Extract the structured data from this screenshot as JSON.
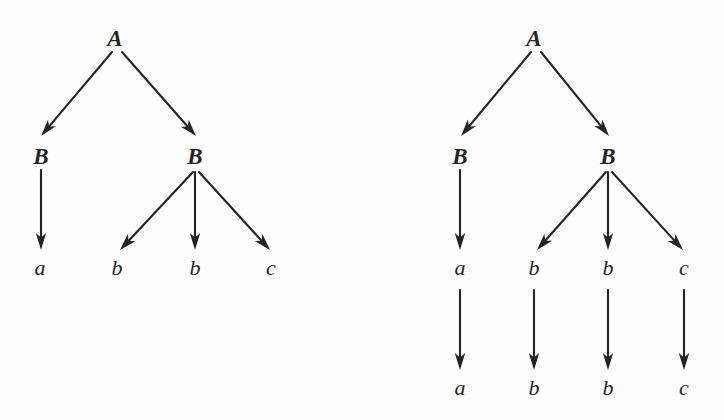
{
  "figure": {
    "caption": "",
    "background_color": "#fdfdfd",
    "ink_color": "#242424",
    "width": 724,
    "height": 420
  },
  "trees": [
    {
      "id": "left-tree",
      "name": "parse-tree-left",
      "nodes": [
        {
          "id": "L-A",
          "label": "A",
          "kind": "nonterminal",
          "x": 115,
          "y": 38
        },
        {
          "id": "L-B1",
          "label": "B",
          "kind": "nonterminal",
          "x": 41,
          "y": 156
        },
        {
          "id": "L-B2",
          "label": "B",
          "kind": "nonterminal",
          "x": 195,
          "y": 156
        },
        {
          "id": "L-a",
          "label": "a",
          "kind": "terminal",
          "x": 40,
          "y": 268
        },
        {
          "id": "L-b1",
          "label": "b",
          "kind": "terminal",
          "x": 117,
          "y": 268
        },
        {
          "id": "L-b2",
          "label": "b",
          "kind": "terminal",
          "x": 195,
          "y": 268
        },
        {
          "id": "L-c",
          "label": "c",
          "kind": "terminal",
          "x": 271,
          "y": 268
        }
      ],
      "edges": [
        {
          "id": "L-e1",
          "from": "L-A",
          "to": "L-B1",
          "x1": 112,
          "y1": 52,
          "x2": 41,
          "y2": 136
        },
        {
          "id": "L-e2",
          "from": "L-A",
          "to": "L-B2",
          "x1": 122,
          "y1": 52,
          "x2": 196,
          "y2": 136
        },
        {
          "id": "L-e3",
          "from": "L-B1",
          "to": "L-a",
          "x1": 41,
          "y1": 170,
          "x2": 41,
          "y2": 250
        },
        {
          "id": "L-e4",
          "from": "L-B2",
          "to": "L-b1",
          "x1": 193,
          "y1": 172,
          "x2": 120,
          "y2": 250
        },
        {
          "id": "L-e5",
          "from": "L-B2",
          "to": "L-b2",
          "x1": 195,
          "y1": 172,
          "x2": 195,
          "y2": 250
        },
        {
          "id": "L-e6",
          "from": "L-B2",
          "to": "L-c",
          "x1": 199,
          "y1": 172,
          "x2": 270,
          "y2": 250
        }
      ]
    },
    {
      "id": "right-tree",
      "name": "parse-tree-right",
      "nodes": [
        {
          "id": "R-A",
          "label": "A",
          "kind": "nonterminal",
          "x": 534,
          "y": 38
        },
        {
          "id": "R-B1",
          "label": "B",
          "kind": "nonterminal",
          "x": 460,
          "y": 156
        },
        {
          "id": "R-B2",
          "label": "B",
          "kind": "nonterminal",
          "x": 608,
          "y": 156
        },
        {
          "id": "R-a1",
          "label": "a",
          "kind": "terminal",
          "x": 460,
          "y": 268
        },
        {
          "id": "R-b1",
          "label": "b",
          "kind": "terminal",
          "x": 534,
          "y": 268
        },
        {
          "id": "R-b2",
          "label": "b",
          "kind": "terminal",
          "x": 608,
          "y": 268
        },
        {
          "id": "R-c1",
          "label": "c",
          "kind": "terminal",
          "x": 684,
          "y": 268
        },
        {
          "id": "R-a2",
          "label": "a",
          "kind": "terminal",
          "x": 460,
          "y": 388
        },
        {
          "id": "R-b3",
          "label": "b",
          "kind": "terminal",
          "x": 534,
          "y": 388
        },
        {
          "id": "R-b4",
          "label": "b",
          "kind": "terminal",
          "x": 608,
          "y": 388
        },
        {
          "id": "R-c2",
          "label": "c",
          "kind": "terminal",
          "x": 684,
          "y": 388
        }
      ],
      "edges": [
        {
          "id": "R-e1",
          "from": "R-A",
          "to": "R-B1",
          "x1": 531,
          "y1": 52,
          "x2": 461,
          "y2": 136
        },
        {
          "id": "R-e2",
          "from": "R-A",
          "to": "R-B2",
          "x1": 541,
          "y1": 52,
          "x2": 609,
          "y2": 136
        },
        {
          "id": "R-e3",
          "from": "R-B1",
          "to": "R-a1",
          "x1": 460,
          "y1": 170,
          "x2": 460,
          "y2": 250
        },
        {
          "id": "R-e4",
          "from": "R-B2",
          "to": "R-b1",
          "x1": 606,
          "y1": 172,
          "x2": 537,
          "y2": 250
        },
        {
          "id": "R-e5",
          "from": "R-B2",
          "to": "R-b2",
          "x1": 608,
          "y1": 172,
          "x2": 608,
          "y2": 250
        },
        {
          "id": "R-e6",
          "from": "R-B2",
          "to": "R-c1",
          "x1": 612,
          "y1": 172,
          "x2": 683,
          "y2": 250
        },
        {
          "id": "R-e7",
          "from": "R-a1",
          "to": "R-a2",
          "x1": 460,
          "y1": 290,
          "x2": 460,
          "y2": 370
        },
        {
          "id": "R-e8",
          "from": "R-b1",
          "to": "R-b3",
          "x1": 534,
          "y1": 290,
          "x2": 534,
          "y2": 370
        },
        {
          "id": "R-e9",
          "from": "R-b2",
          "to": "R-b4",
          "x1": 608,
          "y1": 290,
          "x2": 608,
          "y2": 370
        },
        {
          "id": "R-e10",
          "from": "R-c1",
          "to": "R-c2",
          "x1": 684,
          "y1": 290,
          "x2": 684,
          "y2": 370
        }
      ]
    }
  ]
}
